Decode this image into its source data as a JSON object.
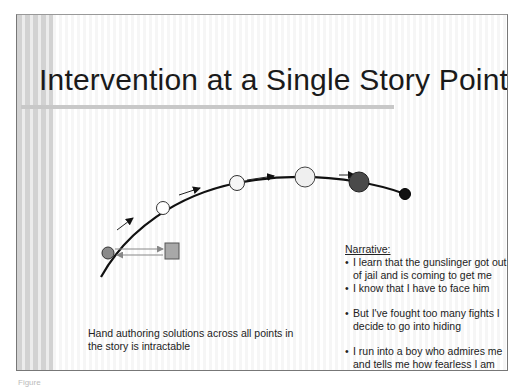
{
  "slide": {
    "title": "Intervention at a Single Story Point",
    "narrative": {
      "heading": "Narrative:",
      "items": [
        {
          "bullet": "•",
          "text": "I learn that the gunslinger got out of jail and is coming to get me"
        },
        {
          "bullet": "•",
          "text": "I know that I have to face him"
        },
        {
          "bullet": "•",
          "text": "But I've fought too many fights I decide to go into hiding"
        },
        {
          "bullet": "•",
          "text": "I run into a boy who admires me and tells me how fearless I am"
        }
      ]
    },
    "note": "Hand authoring solutions across all points in the story is intractable",
    "diagram": {
      "story_points": [
        {
          "name": "point-1",
          "fill": "#8a8a8a"
        },
        {
          "name": "point-2",
          "fill": "#ffffff"
        },
        {
          "name": "point-3",
          "fill": "#f4f4f4"
        },
        {
          "name": "point-4",
          "fill": "#eeeeee"
        },
        {
          "name": "point-5",
          "fill": "#4a4a4a"
        },
        {
          "name": "point-6",
          "fill": "#111111"
        }
      ],
      "intervention_box_fill": "#a8a8a8"
    }
  },
  "caption": "Figure"
}
